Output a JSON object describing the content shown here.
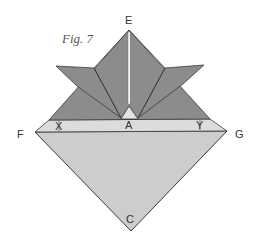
{
  "figure": {
    "caption": "Fig. 7",
    "labels": {
      "E": "E",
      "A": "A",
      "F": "F",
      "G": "G",
      "X": "X",
      "Y": "Y",
      "C": "C"
    },
    "colors": {
      "dark_fold": "#8c8c8c",
      "band": "#dcdcdc",
      "lower_triangle": "#cdcdcd",
      "edge": "#3a3a3a",
      "slit": "#f2f2f2"
    }
  }
}
